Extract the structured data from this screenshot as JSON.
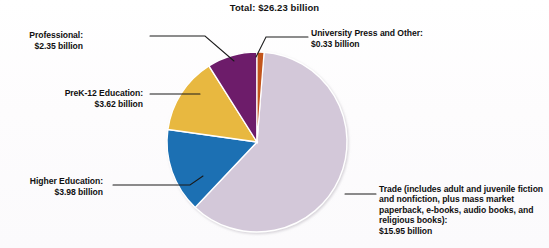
{
  "chart_data": {
    "type": "pie",
    "title": "Total: $26.23 billion",
    "unit": "billion USD",
    "total": 26.23,
    "grid": false,
    "legend_position": "callout-labels",
    "categories": [
      "University Press and Other",
      "Trade (includes adult and juvenile fiction and nonfiction, plus mass market paperback, e-books, audio books, and religious books)",
      "Higher Education",
      "PreK-12 Education",
      "Professional"
    ],
    "values": [
      0.33,
      15.95,
      3.98,
      3.62,
      2.35
    ],
    "slices": [
      {
        "name": "university-press",
        "label": "University Press and Other:",
        "value_label": "$0.33 billion",
        "value": 0.33,
        "percent": 1.3,
        "color": "#c2551f",
        "start_angle": 0,
        "end_angle": 4.5
      },
      {
        "name": "trade",
        "label": "Trade (includes adult and juvenile fiction and nonfiction, plus mass market paperback, e-books, audio books, and religious books):",
        "value_label": "$15.95 billion",
        "value": 15.95,
        "percent": 60.8,
        "color": "#d3c8d9",
        "start_angle": 4.5,
        "end_angle": 223.4
      },
      {
        "name": "higher-education",
        "label": "Higher Education:",
        "value_label": "$3.98 billion",
        "value": 3.98,
        "percent": 15.2,
        "color": "#1b6fb3",
        "start_angle": 223.4,
        "end_angle": 278.0
      },
      {
        "name": "prek12-education",
        "label": "PreK-12 Education:",
        "value_label": "$3.62 billion",
        "value": 3.62,
        "percent": 13.8,
        "color": "#e8b83f",
        "start_angle": 278.0,
        "end_angle": 327.7
      },
      {
        "name": "professional",
        "label": "Professional:",
        "value_label": "$2.35 billion",
        "value": 2.35,
        "percent": 9.0,
        "color": "#6d1c6b",
        "start_angle": 327.7,
        "end_angle": 360
      }
    ]
  },
  "title": {
    "text": "Total: $26.23 billion"
  },
  "labels": {
    "professional": "Professional:\n$2.35 billion",
    "prek12": "PreK-12 Education:\n$3.62 billion",
    "higher_education": "Higher Education:\n$3.98 billion",
    "university_press": "University Press and Other:\n$0.33 billion",
    "trade": "Trade (includes adult and juvenile fiction and nonfiction, plus mass market paperback, e-books, audio books, and religious books):\n$15.95 billion"
  },
  "colors": {
    "trade": "#d3c8d9",
    "higher_education": "#1b6fb3",
    "prek12": "#e8b83f",
    "professional": "#6d1c6b",
    "university_press": "#c2551f",
    "leader_line": "#1a1a1a",
    "text": "#101010",
    "background": "#fdfdfd"
  }
}
